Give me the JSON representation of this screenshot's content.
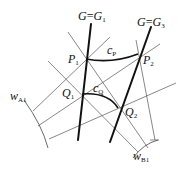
{
  "figure": {
    "type": "geometric-diagram",
    "lines": {
      "G1": {
        "label_main": "G",
        "label_eq": "=",
        "label_rhs": "G",
        "label_sub": "1"
      },
      "G3": {
        "label_main": "G",
        "label_eq": "=",
        "label_rhs": "G",
        "label_sub": "3"
      }
    },
    "points": [
      {
        "id": "P1",
        "main": "P",
        "sub": "1"
      },
      {
        "id": "P2",
        "main": "P",
        "sub": "2"
      },
      {
        "id": "Q1",
        "main": "Q",
        "sub": "1"
      },
      {
        "id": "Q2",
        "main": "Q",
        "sub": "2"
      }
    ],
    "curves": [
      {
        "id": "cP",
        "main": "c",
        "sub": "P"
      },
      {
        "id": "cQ",
        "main": "c",
        "sub": "Q"
      }
    ],
    "arcs": [
      {
        "id": "wA1",
        "main": "w",
        "sub": "A1"
      },
      {
        "id": "wB1",
        "main": "w",
        "sub": "B1"
      }
    ],
    "colors": {
      "stroke": "#111111",
      "thin": "#555555",
      "background": "#ffffff"
    }
  }
}
